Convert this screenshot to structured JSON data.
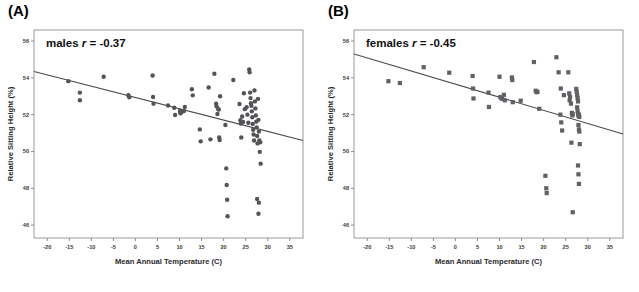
{
  "figure": {
    "panel_a_tag": "(A)",
    "panel_b_tag": "(B)"
  },
  "chart_data": [
    {
      "type": "scatter",
      "panel": "(A)",
      "title": "males r = -0.37",
      "annotation_prefix": "males ",
      "annotation_italic": "r",
      "annotation_suffix": " = -0.37",
      "group": "males",
      "correlation_r": -0.37,
      "marker": "circle",
      "marker_color": "#545458",
      "xlabel": "Mean Annual Temperature (C)",
      "ylabel": "Relative Sitting Height (%)",
      "xlim": [
        -23,
        38
      ],
      "ylim": [
        45.3,
        56.6
      ],
      "xticks": [
        -20,
        -15,
        -10,
        -5,
        0,
        5,
        10,
        15,
        20,
        25,
        30,
        35
      ],
      "xtick_labels": [
        "-20",
        "-15",
        "-10",
        "-5",
        "0",
        "5",
        "10",
        "15",
        "20",
        "25",
        "30",
        "35"
      ],
      "yticks": [
        46,
        48,
        50,
        52,
        54,
        56
      ],
      "ytick_labels": [
        "46",
        "48",
        "50",
        "52",
        "54",
        "56"
      ],
      "grid": false,
      "legend": false,
      "fit_line": {
        "x": [
          -23,
          38
        ],
        "y": [
          54.35,
          50.6
        ]
      },
      "points": [
        [
          -15.2,
          53.82
        ],
        [
          -12.6,
          53.2
        ],
        [
          -12.6,
          52.78
        ],
        [
          -7.2,
          54.06
        ],
        [
          -1.6,
          53.06
        ],
        [
          -1.4,
          52.95
        ],
        [
          3.9,
          54.13
        ],
        [
          4.0,
          52.96
        ],
        [
          4.1,
          52.6
        ],
        [
          7.4,
          52.5
        ],
        [
          8.8,
          52.38
        ],
        [
          9.0,
          51.98
        ],
        [
          10.1,
          52.2
        ],
        [
          10.2,
          52.08
        ],
        [
          10.4,
          52.12
        ],
        [
          11.2,
          52.42
        ],
        [
          11.0,
          52.2
        ],
        [
          12.8,
          53.38
        ],
        [
          13.0,
          53.05
        ],
        [
          14.6,
          51.2
        ],
        [
          14.8,
          50.55
        ],
        [
          16.6,
          53.48
        ],
        [
          17.0,
          50.66
        ],
        [
          17.9,
          54.22
        ],
        [
          18.3,
          52.6
        ],
        [
          18.4,
          52.46
        ],
        [
          18.6,
          52.04
        ],
        [
          18.8,
          52.3
        ],
        [
          18.9,
          52.28
        ],
        [
          19.0,
          50.76
        ],
        [
          19.1,
          50.62
        ],
        [
          19.2,
          53.0
        ],
        [
          20.4,
          51.44
        ],
        [
          20.6,
          49.08
        ],
        [
          20.7,
          48.18
        ],
        [
          20.8,
          47.38
        ],
        [
          20.9,
          46.48
        ],
        [
          22.2,
          53.88
        ],
        [
          23.6,
          52.58
        ],
        [
          23.8,
          51.7
        ],
        [
          23.9,
          51.52
        ],
        [
          24.0,
          50.76
        ],
        [
          24.2,
          51.9
        ],
        [
          24.4,
          51.6
        ],
        [
          24.6,
          53.16
        ],
        [
          24.8,
          52.3
        ],
        [
          25.2,
          52.4
        ],
        [
          25.4,
          52.0
        ],
        [
          25.6,
          51.56
        ],
        [
          25.8,
          54.46
        ],
        [
          25.9,
          54.3
        ],
        [
          26.0,
          53.2
        ],
        [
          26.1,
          52.9
        ],
        [
          26.2,
          52.62
        ],
        [
          26.3,
          52.48
        ],
        [
          26.4,
          52.18
        ],
        [
          26.5,
          51.86
        ],
        [
          26.6,
          51.5
        ],
        [
          26.7,
          51.18
        ],
        [
          26.8,
          50.92
        ],
        [
          26.9,
          50.6
        ],
        [
          27.0,
          53.32
        ],
        [
          27.1,
          52.72
        ],
        [
          27.2,
          52.34
        ],
        [
          27.3,
          51.96
        ],
        [
          27.4,
          51.62
        ],
        [
          27.5,
          51.3
        ],
        [
          27.6,
          50.84
        ],
        [
          27.7,
          50.44
        ],
        [
          27.8,
          52.86
        ],
        [
          27.9,
          51.72
        ],
        [
          28.0,
          51.08
        ],
        [
          28.1,
          50.6
        ],
        [
          28.2,
          49.98
        ],
        [
          28.3,
          50.5
        ],
        [
          28.4,
          49.34
        ],
        [
          27.6,
          47.42
        ],
        [
          28.0,
          47.22
        ],
        [
          27.9,
          46.62
        ]
      ]
    },
    {
      "type": "scatter",
      "panel": "(B)",
      "title": "females r = -0.45",
      "annotation_prefix": "females ",
      "annotation_italic": "r",
      "annotation_suffix": " = -0.45",
      "group": "females",
      "correlation_r": -0.45,
      "marker": "square",
      "marker_color": "#606065",
      "xlabel": "Mean Annual Temperature (C)",
      "ylabel": "Relative Sitting Height (%)",
      "xlim": [
        -23,
        38
      ],
      "ylim": [
        45.3,
        56.6
      ],
      "xticks": [
        -20,
        -15,
        -10,
        -5,
        0,
        5,
        10,
        15,
        20,
        25,
        30,
        35
      ],
      "xtick_labels": [
        "-20",
        "-15",
        "-10",
        "-5",
        "0",
        "5",
        "10",
        "15",
        "20",
        "25",
        "30",
        "35"
      ],
      "yticks": [
        46,
        48,
        50,
        52,
        54,
        56
      ],
      "ytick_labels": [
        "46",
        "48",
        "50",
        "52",
        "54",
        "56"
      ],
      "grid": false,
      "legend": false,
      "fit_line": {
        "x": [
          -23,
          38
        ],
        "y": [
          55.3,
          50.95
        ]
      },
      "points": [
        [
          -15.2,
          53.82
        ],
        [
          -12.6,
          53.72
        ],
        [
          -7.2,
          54.58
        ],
        [
          -1.4,
          54.28
        ],
        [
          3.9,
          54.1
        ],
        [
          4.0,
          53.42
        ],
        [
          4.1,
          52.88
        ],
        [
          7.5,
          53.2
        ],
        [
          7.6,
          52.42
        ],
        [
          10.0,
          54.06
        ],
        [
          10.2,
          52.96
        ],
        [
          10.4,
          52.92
        ],
        [
          10.6,
          52.86
        ],
        [
          11.0,
          53.08
        ],
        [
          11.2,
          52.78
        ],
        [
          12.8,
          54.02
        ],
        [
          12.9,
          53.88
        ],
        [
          13.0,
          52.68
        ],
        [
          14.8,
          52.76
        ],
        [
          17.8,
          54.86
        ],
        [
          18.2,
          53.3
        ],
        [
          18.4,
          53.22
        ],
        [
          18.6,
          53.24
        ],
        [
          19.0,
          52.32
        ],
        [
          20.4,
          48.68
        ],
        [
          20.6,
          48.0
        ],
        [
          20.7,
          47.74
        ],
        [
          22.9,
          55.12
        ],
        [
          23.4,
          54.3
        ],
        [
          23.8,
          52.0
        ],
        [
          24.0,
          51.58
        ],
        [
          24.2,
          51.14
        ],
        [
          23.9,
          53.42
        ],
        [
          24.6,
          53.06
        ],
        [
          25.6,
          54.3
        ],
        [
          25.8,
          53.16
        ],
        [
          25.9,
          52.78
        ],
        [
          26.0,
          52.96
        ],
        [
          26.2,
          52.6
        ],
        [
          26.4,
          52.1
        ],
        [
          26.5,
          51.96
        ],
        [
          26.6,
          52.02
        ],
        [
          26.3,
          50.48
        ],
        [
          26.6,
          46.7
        ],
        [
          27.4,
          53.4
        ],
        [
          27.5,
          53.24
        ],
        [
          27.6,
          53.06
        ],
        [
          27.7,
          52.9
        ],
        [
          27.8,
          52.72
        ],
        [
          27.6,
          52.4
        ],
        [
          27.7,
          52.2
        ],
        [
          27.8,
          52.04
        ],
        [
          27.9,
          51.94
        ],
        [
          28.0,
          52.0
        ],
        [
          28.1,
          51.88
        ],
        [
          27.9,
          51.44
        ],
        [
          28.0,
          51.2
        ],
        [
          28.1,
          51.08
        ],
        [
          28.2,
          50.4
        ],
        [
          27.8,
          49.24
        ],
        [
          27.9,
          48.76
        ],
        [
          28.0,
          48.24
        ]
      ]
    }
  ]
}
